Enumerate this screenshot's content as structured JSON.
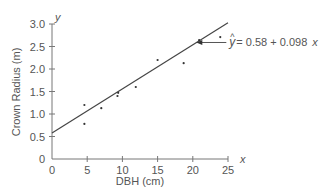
{
  "chart_data": {
    "type": "scatter",
    "title": "",
    "xlabel": "DBH (cm)",
    "ylabel": "Crown Radius (m)",
    "x_axis_symbol": "x",
    "y_axis_symbol": "y",
    "xlim": [
      0,
      25
    ],
    "ylim": [
      0,
      3.0
    ],
    "x_ticks": [
      "0",
      "5",
      "10",
      "15",
      "20",
      "25"
    ],
    "y_ticks": [
      "0",
      "0.5",
      "1.0",
      "1.5",
      "2.0",
      "2.5",
      "3.0"
    ],
    "grid": false,
    "legend": null,
    "points": [
      {
        "x": 4.6,
        "y": 1.2
      },
      {
        "x": 4.6,
        "y": 0.78
      },
      {
        "x": 7.0,
        "y": 1.13
      },
      {
        "x": 9.3,
        "y": 1.4
      },
      {
        "x": 9.4,
        "y": 1.47
      },
      {
        "x": 11.9,
        "y": 1.6
      },
      {
        "x": 15.0,
        "y": 2.2
      },
      {
        "x": 18.7,
        "y": 2.13
      },
      {
        "x": 20.9,
        "y": 2.64
      },
      {
        "x": 23.9,
        "y": 2.71
      }
    ],
    "regression_line": {
      "intercept": 0.58,
      "slope": 0.098,
      "x_range": [
        0,
        25
      ]
    },
    "annotation": {
      "text_hat": "^",
      "text_y": "y",
      "text_eq": "= 0.58 + 0.098",
      "text_x": "x",
      "arrow_target_x": 20.5
    }
  }
}
